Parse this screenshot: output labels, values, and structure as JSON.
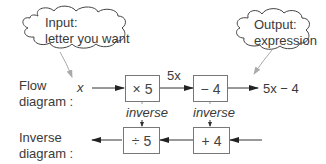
{
  "clouds": {
    "input": {
      "line1": "Input:",
      "line2": "letter you want"
    },
    "output": {
      "line1": "Output:",
      "line2": "expression"
    }
  },
  "flow": {
    "label_line1": "Flow",
    "label_line2": "diagram :",
    "input_var": "x",
    "box1": "× 5",
    "intermediate": "5x",
    "box2": "− 4",
    "result": "5x − 4"
  },
  "inverse_labels": {
    "left": "inverse",
    "right": "inverse"
  },
  "inverse": {
    "label_line1": "Inverse",
    "label_line2": "diagram :",
    "box1": "÷ 5",
    "box2": "+ 4"
  },
  "colors": {
    "line": "#333333",
    "cloud_arrow": "#aaaaaa",
    "box_border": "#777777"
  }
}
